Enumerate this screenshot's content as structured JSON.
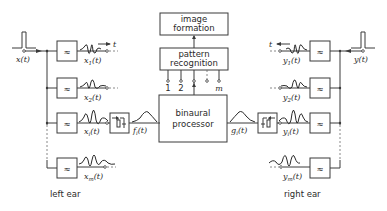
{
  "diagram": {
    "type": "block-diagram",
    "blocks": {
      "image_formation": {
        "line1": "image",
        "line2": "formation"
      },
      "pattern_recognition": {
        "line1": "pattern",
        "line2": "recognition"
      },
      "binaural_processor": {
        "line1": "binaural",
        "line2": "processor"
      }
    },
    "channel_indices": [
      "1",
      "2",
      "i",
      "m"
    ],
    "left": {
      "input_label": "x(t)",
      "input_var": "x",
      "channels": [
        {
          "var": "x",
          "sub": "1"
        },
        {
          "var": "x",
          "sub": "2"
        },
        {
          "var": "x",
          "sub": "i"
        },
        {
          "var": "x",
          "sub": "m"
        }
      ],
      "time_arrow_label": "t",
      "envelope_var": "f",
      "envelope_sub": "i",
      "ear_label": "left ear"
    },
    "right": {
      "input_label": "y(t)",
      "input_var": "y",
      "channels": [
        {
          "var": "y",
          "sub": "1"
        },
        {
          "var": "y",
          "sub": "2"
        },
        {
          "var": "y",
          "sub": "i"
        },
        {
          "var": "y",
          "sub": "m"
        }
      ],
      "time_arrow_label": "t",
      "envelope_var": "g",
      "envelope_sub": "i",
      "ear_label": "right ear"
    },
    "icons": {
      "filter": "bandpass-filter-icon (≈)",
      "rectifier": "half-wave-rectifier-lowpass-icon",
      "impulse": "impulse-signal-icon"
    },
    "colors": {
      "line": "#3a3a3a",
      "background": "#ffffff"
    }
  }
}
